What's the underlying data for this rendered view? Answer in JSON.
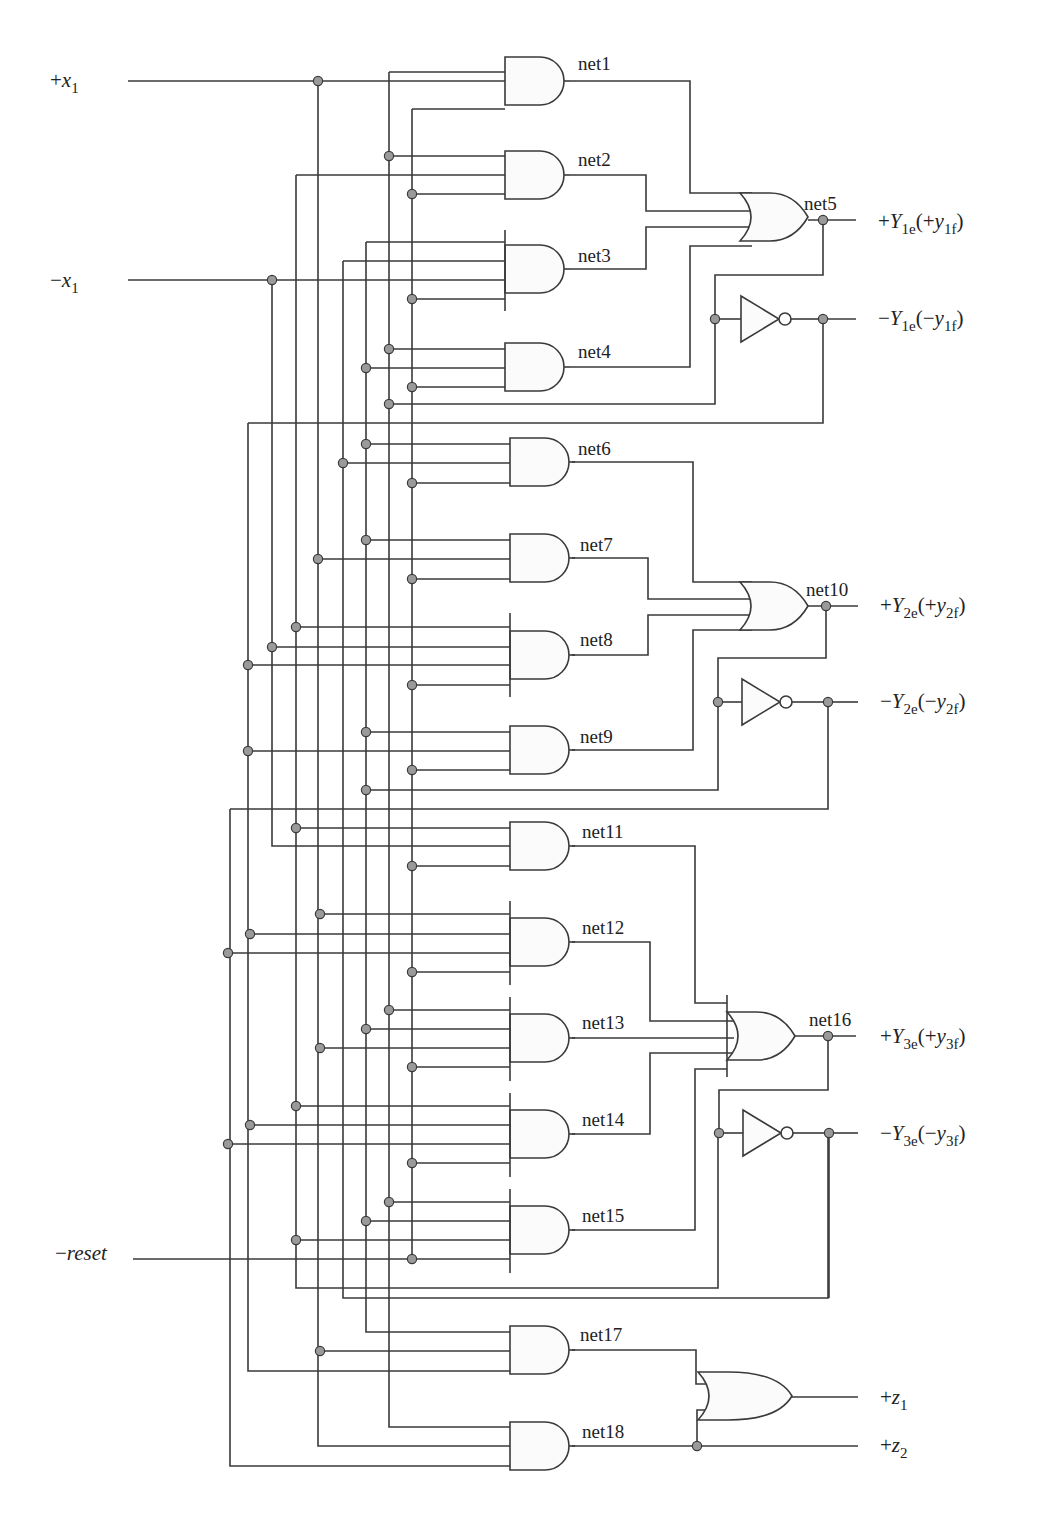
{
  "colors": {
    "wire": "#3a3a3a",
    "junction": "#9a9a9a",
    "gate_fill": "#fbfbfb",
    "background": "#ffffff"
  },
  "inputs": [
    {
      "id": "plus-x1",
      "sign": "+",
      "name": "x",
      "sub": "1",
      "x": 50,
      "y": 87,
      "line_from": 128,
      "line_to": 318
    },
    {
      "id": "minus-x1",
      "sign": "−",
      "name": "x",
      "sub": "1",
      "x": 50,
      "y": 287,
      "line_from": 128,
      "line_to": 272
    },
    {
      "id": "minus-reset",
      "sign": "−",
      "name": "reset",
      "sub": "",
      "x": 55,
      "y": 1260,
      "line_from": 133,
      "line_to": 412
    }
  ],
  "outputs": [
    {
      "id": "plus-Y1e",
      "text": "+Y",
      "sub1": "1e",
      "mid": "(+y",
      "sub2": "1f",
      "end": ")",
      "x": 878,
      "y": 228
    },
    {
      "id": "minus-Y1e",
      "text": "−Y",
      "sub1": "1e",
      "mid": "(−y",
      "sub2": "1f",
      "end": ")",
      "x": 878,
      "y": 325
    },
    {
      "id": "plus-Y2e",
      "text": "+Y",
      "sub1": "2e",
      "mid": "(+y",
      "sub2": "2f",
      "end": ")",
      "x": 880,
      "y": 612
    },
    {
      "id": "minus-Y2e",
      "text": "−Y",
      "sub1": "2e",
      "mid": "(−y",
      "sub2": "2f",
      "end": ")",
      "x": 880,
      "y": 708
    },
    {
      "id": "plus-Y3e",
      "text": "+Y",
      "sub1": "3e",
      "mid": "(+y",
      "sub2": "3f",
      "end": ")",
      "x": 880,
      "y": 1043
    },
    {
      "id": "minus-Y3e",
      "text": "−Y",
      "sub1": "3e",
      "mid": "(−y",
      "sub2": "3f",
      "end": ")",
      "x": 880,
      "y": 1140
    },
    {
      "id": "plus-z1",
      "text": "+z",
      "sub1": "1",
      "mid": "",
      "sub2": "",
      "end": "",
      "x": 880,
      "y": 1404
    },
    {
      "id": "plus-z2",
      "text": "+z",
      "sub1": "2",
      "mid": "",
      "sub2": "",
      "end": "",
      "x": 880,
      "y": 1452
    }
  ],
  "and_gates": [
    {
      "net": "net1",
      "x": 505,
      "ytop": 55,
      "inputs": [
        72,
        90,
        109
      ],
      "out_y": 81,
      "label_x": 578,
      "label_y": 70
    },
    {
      "net": "net2",
      "x": 505,
      "ytop": 151,
      "inputs": [
        156,
        175,
        194
      ],
      "out_y": 175,
      "label_x": 578,
      "label_y": 166
    },
    {
      "net": "net3",
      "x": 505,
      "ytop": 245,
      "bar": [
        230,
        311
      ],
      "inputs": [
        252,
        271,
        290,
        309
      ],
      "out_y": 269,
      "label_x": 578,
      "label_y": 262
    },
    {
      "net": "net4",
      "x": 505,
      "ytop": 343,
      "inputs": [
        349,
        368,
        387
      ],
      "out_y": 367,
      "label_x": 578,
      "label_y": 358
    },
    {
      "net": "net5o",
      "skip": true
    },
    {
      "net": "net6",
      "x": 510,
      "ytop": 439,
      "inputs": [
        444,
        463,
        483
      ],
      "out_y": 462,
      "label_x": 578,
      "label_y": 455
    },
    {
      "net": "net7",
      "x": 510,
      "ytop": 535,
      "inputs": [
        540,
        559,
        579
      ],
      "out_y": 558,
      "label_x": 580,
      "label_y": 551
    },
    {
      "net": "net8",
      "x": 510,
      "ytop": 630,
      "bar": [
        613,
        697
      ],
      "inputs": [
        627,
        647,
        665,
        685
      ],
      "out_y": 655,
      "label_x": 580,
      "label_y": 646
    },
    {
      "net": "net9",
      "x": 510,
      "ytop": 727,
      "inputs": [
        732,
        751,
        770
      ],
      "out_y": 750,
      "label_x": 580,
      "label_y": 743
    },
    {
      "net": "net11",
      "x": 510,
      "ytop": 822,
      "inputs": [
        828,
        847,
        866
      ],
      "out_y": 846,
      "label_x": 582,
      "label_y": 838
    },
    {
      "net": "net12",
      "x": 510,
      "ytop": 918,
      "bar": [
        901,
        985
      ],
      "inputs": [
        914,
        934,
        953,
        972
      ],
      "out_y": 942,
      "label_x": 582,
      "label_y": 934
    },
    {
      "net": "net13",
      "x": 510,
      "ytop": 1014,
      "bar": [
        997,
        1081
      ],
      "inputs": [
        1010,
        1029,
        1048,
        1067
      ],
      "out_y": 1038,
      "label_x": 582,
      "label_y": 1029
    },
    {
      "net": "net14",
      "x": 510,
      "ytop": 1110,
      "bar": [
        1093,
        1177
      ],
      "inputs": [
        1106,
        1125,
        1144,
        1163
      ],
      "out_y": 1134,
      "label_x": 582,
      "label_y": 1126
    },
    {
      "net": "net15",
      "x": 510,
      "ytop": 1206,
      "bar": [
        1189,
        1273
      ],
      "inputs": [
        1202,
        1221,
        1240,
        1259
      ],
      "out_y": 1230,
      "label_x": 582,
      "label_y": 1222
    },
    {
      "net": "net17",
      "x": 510,
      "ytop": 1327,
      "inputs": [
        1332,
        1351,
        1371
      ],
      "out_y": 1350,
      "label_x": 580,
      "label_y": 1341
    },
    {
      "net": "net18",
      "x": 510,
      "ytop": 1422,
      "inputs": [
        1427,
        1446,
        1466
      ],
      "out_y": 1446,
      "label_x": 582,
      "label_y": 1438
    }
  ],
  "or_gates": [
    {
      "net": "net5",
      "x": 740,
      "ytop": 193,
      "h": 48,
      "out_x": 808,
      "label_x": 804,
      "label_y": 210
    },
    {
      "net": "net10",
      "x": 740,
      "ytop": 582,
      "h": 48,
      "out_x": 808,
      "label_x": 806,
      "label_y": 596
    },
    {
      "net": "net16",
      "x": 727,
      "ytop": 1012,
      "h": 48,
      "out_x": 795,
      "label_x": 809,
      "label_y": 1026
    },
    {
      "net": "z1-or",
      "x": 698,
      "ytop": 1372,
      "h": 48,
      "out_x": 792,
      "label_x": 0,
      "label_y": 0,
      "nolabel": true
    }
  ],
  "inverters": [
    {
      "id": "inv1",
      "x": 741,
      "y": 319
    },
    {
      "id": "inv2",
      "x": 742,
      "y": 702
    },
    {
      "id": "inv3",
      "x": 743,
      "y": 1133
    }
  ],
  "labels": {
    "net1": "net1",
    "net2": "net2",
    "net3": "net3",
    "net4": "net4",
    "net5": "net5",
    "net6": "net6",
    "net7": "net7",
    "net8": "net8",
    "net9": "net9",
    "net10": "net10",
    "net11": "net11",
    "net12": "net12",
    "net13": "net13",
    "net14": "net14",
    "net15": "net15",
    "net16": "net16",
    "net17": "net17",
    "net18": "net18"
  }
}
